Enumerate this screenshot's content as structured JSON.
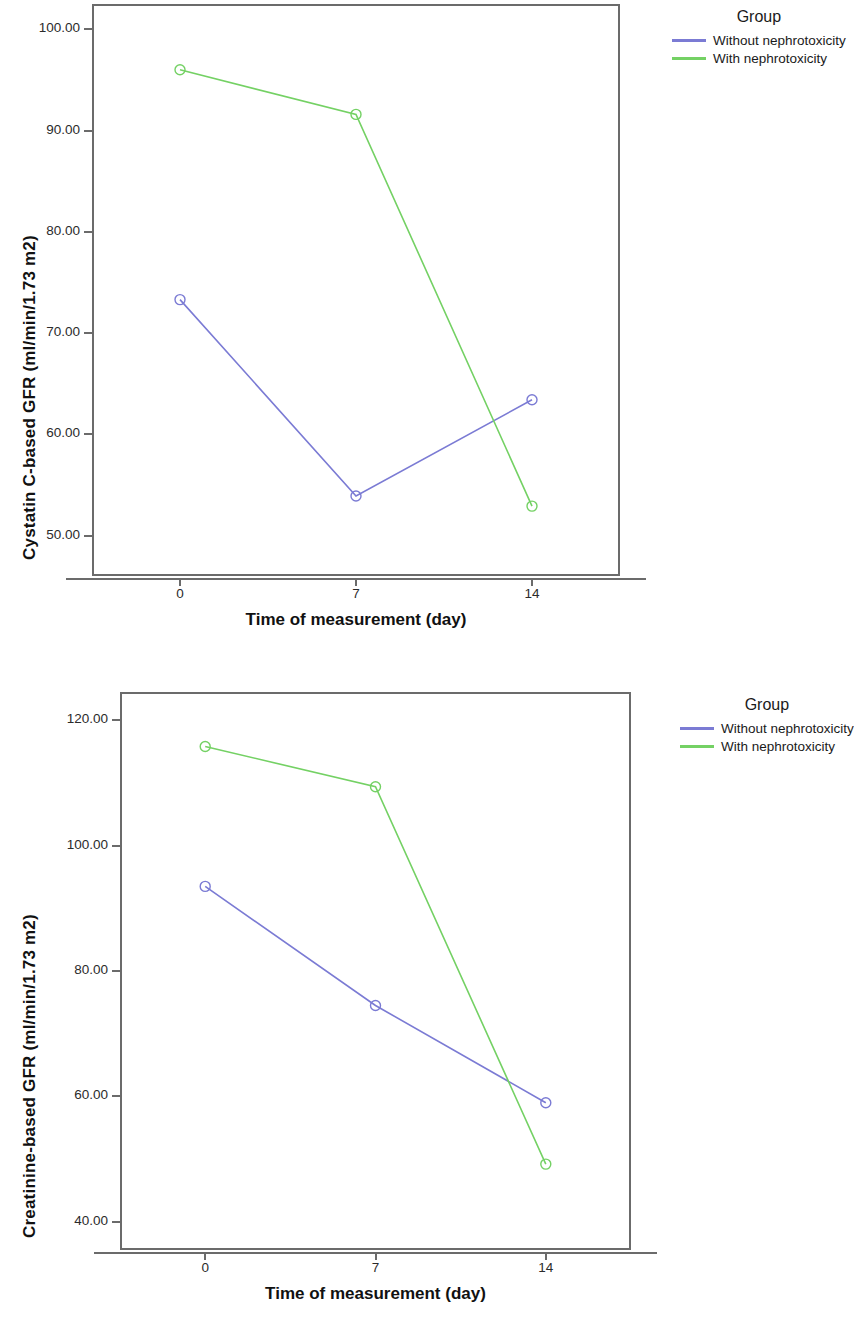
{
  "charts": [
    {
      "id": "cystatin-c-chart",
      "legend": {
        "title": "Group",
        "entries": [
          {
            "label": "Without nephrotoxicity",
            "color": "#7b7bd4"
          },
          {
            "label": "With nephrotoxicity",
            "color": "#74d164"
          }
        ]
      },
      "chart_data": {
        "type": "line",
        "title": "",
        "xlabel": "Time of measurement (day)",
        "ylabel": "Cystatin C-based GFR (ml/min/1.73 m2)",
        "x": [
          0,
          7,
          14
        ],
        "xtick_labels": [
          "0",
          "7",
          "14"
        ],
        "ytick_labels": [
          "100.00",
          "90.00",
          "80.00",
          "70.00",
          "60.00",
          "50.00"
        ],
        "yticks": [
          100,
          90,
          80,
          70,
          60,
          50
        ],
        "ylim": [
          46,
          102.5
        ],
        "xlim": [
          -3.5,
          17.5
        ],
        "grid": false,
        "legend_position": "right",
        "marker": "open-circle",
        "series": [
          {
            "name": "Without nephrotoxicity",
            "color": "#7b7bd4",
            "values": [
              73.3,
              53.9,
              63.4
            ]
          },
          {
            "name": "With nephrotoxicity",
            "color": "#74d164",
            "values": [
              96.0,
              91.6,
              52.9
            ]
          }
        ]
      }
    },
    {
      "id": "creatinine-chart",
      "legend": {
        "title": "Group",
        "entries": [
          {
            "label": "Without nephrotoxicity",
            "color": "#7b7bd4"
          },
          {
            "label": "With nephrotoxicity",
            "color": "#74d164"
          }
        ]
      },
      "chart_data": {
        "type": "line",
        "title": "",
        "xlabel": "Time of measurement (day)",
        "ylabel": "Creatinine-based GFR (ml/min/1.73 m2)",
        "x": [
          0,
          7,
          14
        ],
        "xtick_labels": [
          "0",
          "7",
          "14"
        ],
        "ytick_labels": [
          "120.00",
          "100.00",
          "80.00",
          "60.00",
          "40.00"
        ],
        "yticks": [
          120,
          100,
          80,
          60,
          40
        ],
        "ylim": [
          35.5,
          124.5
        ],
        "xlim": [
          -3.5,
          17.5
        ],
        "grid": false,
        "legend_position": "right",
        "marker": "open-circle",
        "series": [
          {
            "name": "Without nephrotoxicity",
            "color": "#7b7bd4",
            "values": [
              93.5,
              74.5,
              59.0
            ]
          },
          {
            "name": "With nephrotoxicity",
            "color": "#74d164",
            "values": [
              115.8,
              109.4,
              49.2
            ]
          }
        ]
      }
    }
  ],
  "geometry": [
    {
      "frame": {
        "left": 92,
        "top": 4,
        "width": 528,
        "height": 572
      },
      "ylabel": {
        "left": 20,
        "bottom_y": 560
      },
      "xlabel": {
        "left": 92,
        "top": 610,
        "width": 528
      },
      "axis_tick_row_y": 578,
      "xtick_label_y": 586,
      "legend": {
        "left": 672,
        "top": 8
      }
    },
    {
      "frame": {
        "left": 120,
        "top": 692,
        "width": 511,
        "height": 558
      },
      "ylabel": {
        "left": 20,
        "bottom_y": 1238
      },
      "xlabel": {
        "left": 120,
        "top": 1284,
        "width": 511
      },
      "axis_tick_row_y": 1252,
      "xtick_label_y": 1260,
      "legend": {
        "left": 680,
        "top": 696
      }
    }
  ]
}
